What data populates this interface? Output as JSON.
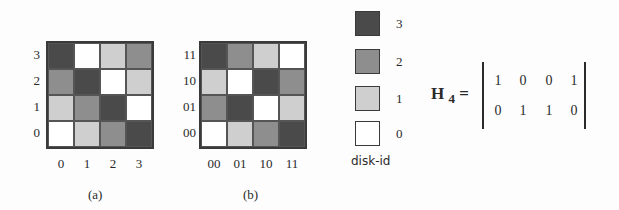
{
  "colors": {
    "v0": "#ffffff",
    "v1": "#cfcfcf",
    "v2": "#8e8e8e",
    "v3": "#4a4a4a"
  },
  "panel_a": {
    "caption": "(a)",
    "row_labels": [
      "3",
      "2",
      "1",
      "0"
    ],
    "col_labels": [
      "0",
      "1",
      "2",
      "3"
    ],
    "cells": [
      [
        3,
        0,
        1,
        2
      ],
      [
        2,
        3,
        0,
        1
      ],
      [
        1,
        2,
        3,
        0
      ],
      [
        0,
        1,
        2,
        3
      ]
    ]
  },
  "panel_b": {
    "caption": "(b)",
    "row_labels": [
      "11",
      "10",
      "01",
      "00"
    ],
    "col_labels": [
      "00",
      "01",
      "10",
      "11"
    ],
    "cells": [
      [
        3,
        2,
        1,
        0
      ],
      [
        1,
        0,
        3,
        2
      ],
      [
        2,
        3,
        0,
        1
      ],
      [
        0,
        1,
        2,
        3
      ]
    ]
  },
  "legend": {
    "title": "disk-id",
    "items": [
      {
        "value": 3,
        "label": "3"
      },
      {
        "value": 2,
        "label": "2"
      },
      {
        "value": 1,
        "label": "1"
      },
      {
        "value": 0,
        "label": "0"
      }
    ]
  },
  "matrix": {
    "name": "H",
    "subscript": "4",
    "equals": "=",
    "rows": [
      [
        "1",
        "0",
        "0",
        "1"
      ],
      [
        "0",
        "1",
        "1",
        "0"
      ]
    ]
  },
  "chart_data": {
    "type": "heatmap",
    "title": "",
    "panels": [
      {
        "caption": "(a)",
        "y_labels": [
          "3",
          "2",
          "1",
          "0"
        ],
        "x_labels": [
          "0",
          "1",
          "2",
          "3"
        ],
        "values": [
          [
            3,
            0,
            1,
            2
          ],
          [
            2,
            3,
            0,
            1
          ],
          [
            1,
            2,
            3,
            0
          ],
          [
            0,
            1,
            2,
            3
          ]
        ]
      },
      {
        "caption": "(b)",
        "y_labels": [
          "11",
          "10",
          "01",
          "00"
        ],
        "x_labels": [
          "00",
          "01",
          "10",
          "11"
        ],
        "values": [
          [
            3,
            2,
            1,
            0
          ],
          [
            1,
            0,
            3,
            2
          ],
          [
            2,
            3,
            0,
            1
          ],
          [
            0,
            1,
            2,
            3
          ]
        ]
      }
    ],
    "legend": {
      "title": "disk-id",
      "levels": [
        3,
        2,
        1,
        0
      ]
    },
    "matrix_H4": [
      [
        1,
        0,
        0,
        1
      ],
      [
        0,
        1,
        1,
        0
      ]
    ]
  }
}
